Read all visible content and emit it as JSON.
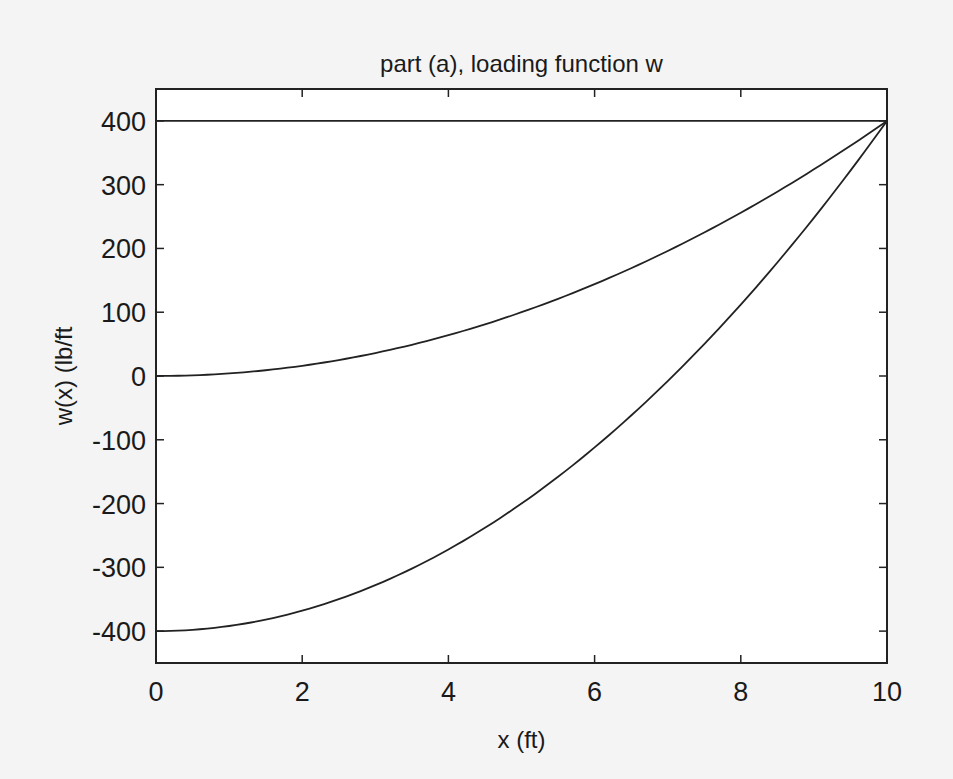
{
  "chart_data": {
    "type": "line",
    "title": "part (a), loading function w",
    "xlabel": "x (ft)",
    "ylabel": "w(x)  (lb/ft",
    "xlim": [
      0,
      10
    ],
    "ylim": [
      -450,
      450
    ],
    "xticks": [
      0,
      2,
      4,
      6,
      8,
      10
    ],
    "yticks": [
      400,
      300,
      200,
      100,
      0,
      -100,
      -200,
      -300,
      -400
    ],
    "grid": false,
    "legend": null,
    "line_color": "#222222",
    "x": [
      0,
      1,
      2,
      3,
      4,
      5,
      6,
      7,
      8,
      9,
      10
    ],
    "series": [
      {
        "name": "constant",
        "values": [
          400,
          400,
          400,
          400,
          400,
          400,
          400,
          400,
          400,
          400,
          400
        ]
      },
      {
        "name": "quadratic 0 to 400",
        "values": [
          0,
          4,
          16,
          36,
          64,
          100,
          144,
          196,
          256,
          324,
          400
        ]
      },
      {
        "name": "quadratic -400 to 400",
        "values": [
          -400,
          -392,
          -368,
          -328,
          -272,
          -200,
          -112,
          -8,
          112,
          248,
          400
        ]
      }
    ]
  }
}
